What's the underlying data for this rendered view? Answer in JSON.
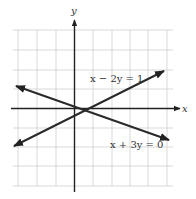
{
  "figure": {
    "type": "coordinate-plane-lines",
    "axes": {
      "x_label": "x",
      "y_label": "y"
    },
    "grid": {
      "visible": true,
      "x_range_units": [
        -3,
        5
      ],
      "y_range_units": [
        -4,
        4
      ]
    },
    "lines": [
      {
        "equation": "x − 2y = 1",
        "label": "x − 2y = 1",
        "slope": 0.5,
        "y_intercept": -0.5
      },
      {
        "equation": "x + 3y = 0",
        "label": "x + 3y = 0",
        "slope": -0.3333,
        "y_intercept": 0
      }
    ],
    "intersection": {
      "x": 0.6,
      "y": -0.2
    }
  },
  "colors": {
    "grid": "#cfcfcf",
    "axis": "#222222",
    "line": "#2a2a2a",
    "text": "#333333",
    "background": "#ffffff"
  }
}
